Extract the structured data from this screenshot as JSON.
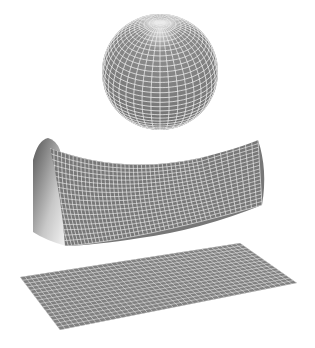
{
  "figure": {
    "background": "#ffffff",
    "surface_color": "#7a7a7a",
    "grid_color": "#e8e8e8",
    "shapes": [
      {
        "name": "sphere",
        "curvature": "positive"
      },
      {
        "name": "saddle",
        "curvature": "negative"
      },
      {
        "name": "flat-plane",
        "curvature": "zero"
      }
    ]
  }
}
